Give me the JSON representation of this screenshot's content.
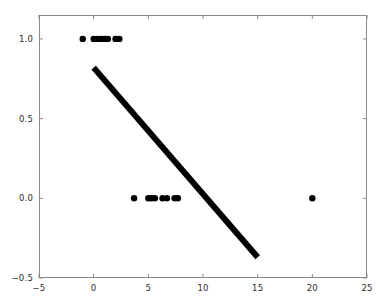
{
  "chart_data": {
    "type": "scatter",
    "title": "",
    "xlabel": "",
    "ylabel": "",
    "xlim": [
      -5,
      25
    ],
    "ylim": [
      -0.5,
      1.15
    ],
    "grid": false,
    "legend": null,
    "xticks": [
      -5,
      0,
      5,
      10,
      15,
      20,
      25
    ],
    "xticklabels": [
      "−5",
      "0",
      "5",
      "10",
      "15",
      "20",
      "25"
    ],
    "yticks": [
      -0.5,
      0.0,
      0.5,
      1.0
    ],
    "yticklabels": [
      "−0.5",
      "0.0",
      "0.5",
      "1.0"
    ],
    "series": [
      {
        "name": "class-1-points",
        "type": "scatter",
        "marker": "circle",
        "color": "#000000",
        "marker_size": 3.2,
        "points": [
          {
            "x": -1.0,
            "y": 1.0
          },
          {
            "x": 0.0,
            "y": 1.0
          },
          {
            "x": 0.35,
            "y": 1.0
          },
          {
            "x": 0.7,
            "y": 1.0
          },
          {
            "x": 1.0,
            "y": 1.0
          },
          {
            "x": 1.3,
            "y": 1.0
          },
          {
            "x": 2.0,
            "y": 1.0
          },
          {
            "x": 2.35,
            "y": 1.0
          }
        ]
      },
      {
        "name": "class-0-points",
        "type": "scatter",
        "marker": "circle",
        "color": "#000000",
        "marker_size": 3.2,
        "points": [
          {
            "x": 3.7,
            "y": 0.0
          },
          {
            "x": 5.0,
            "y": 0.0
          },
          {
            "x": 5.3,
            "y": 0.0
          },
          {
            "x": 5.6,
            "y": 0.0
          },
          {
            "x": 6.3,
            "y": 0.0
          },
          {
            "x": 6.7,
            "y": 0.0
          },
          {
            "x": 7.4,
            "y": 0.0
          },
          {
            "x": 7.7,
            "y": 0.0
          },
          {
            "x": 20.0,
            "y": 0.0
          }
        ]
      },
      {
        "name": "fit-line",
        "type": "line",
        "color": "#000000",
        "linewidth": 6,
        "points": [
          {
            "x": 0.0,
            "y": 0.82
          },
          {
            "x": 15.0,
            "y": -0.37
          }
        ]
      }
    ]
  },
  "figure": {
    "background_color": "#ffffff",
    "axes_edge_color": "#8a8a8a",
    "tick_color": "#8a8a8a",
    "tick_label_color": "#2b2b2b"
  }
}
